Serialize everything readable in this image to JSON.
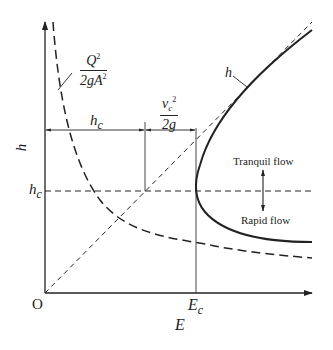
{
  "diagram": {
    "axes": {
      "x_label": "E",
      "y_label": "h",
      "origin_label": "O"
    },
    "labels": {
      "hc_axis_tick": "h",
      "hc_axis_sub": "c",
      "Ec_tick": "E",
      "Ec_sub": "c",
      "hc_dimension": "h",
      "hc_dimension_sub": "c",
      "velocity_head_num": "v",
      "velocity_head_num_sub": "c",
      "velocity_head_num_sup": "2",
      "velocity_head_den": "2g",
      "kinetic_term_num": "Q",
      "kinetic_term_num_sup": "2",
      "kinetic_term_den": "2gA",
      "kinetic_term_den_sup": "2",
      "line_h": "h",
      "tranquil": "Tranquil flow",
      "rapid": "Rapid flow"
    },
    "curves": [
      {
        "name": "E-h specific energy curve",
        "style": "solid"
      },
      {
        "name": "h = E reference line (45°)",
        "style": "dashed"
      },
      {
        "name": "Q²/2gA² kinetic energy curve",
        "style": "long-dashed"
      },
      {
        "name": "critical depth line h = hc",
        "style": "dashed"
      }
    ],
    "colors": {
      "ink": "#222222",
      "background": "#ffffff"
    }
  }
}
